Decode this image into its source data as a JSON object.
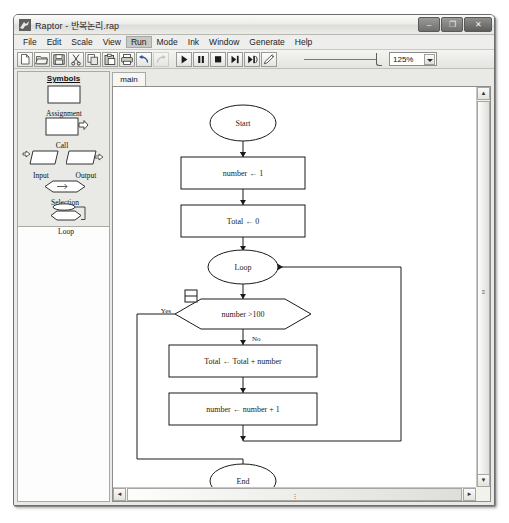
{
  "window": {
    "title": "Raptor - 반복논리.rap",
    "app_icon": "raptor-bird-icon",
    "controls": {
      "minimize": "–",
      "maximize": "❐",
      "close": "✕"
    }
  },
  "menu": {
    "items": [
      {
        "label": "File",
        "mnemonic": "F"
      },
      {
        "label": "Edit",
        "mnemonic": "E"
      },
      {
        "label": "Scale",
        "mnemonic": "S"
      },
      {
        "label": "View",
        "mnemonic": "V"
      },
      {
        "label": "Run",
        "mnemonic": "R",
        "active": true
      },
      {
        "label": "Mode",
        "mnemonic": "M"
      },
      {
        "label": "Ink",
        "mnemonic": "I"
      },
      {
        "label": "Window",
        "mnemonic": "W"
      },
      {
        "label": "Generate",
        "mnemonic": "G"
      },
      {
        "label": "Help",
        "mnemonic": "H"
      }
    ]
  },
  "toolbar": {
    "buttons": [
      {
        "name": "new-file-icon",
        "enabled": true
      },
      {
        "name": "open-folder-icon",
        "enabled": true
      },
      {
        "name": "save-disk-icon",
        "enabled": true
      },
      {
        "name": "cut-scissors-icon",
        "enabled": true
      },
      {
        "name": "copy-icon",
        "enabled": true
      },
      {
        "name": "paste-icon",
        "enabled": true
      },
      {
        "name": "print-icon",
        "enabled": true
      },
      {
        "name": "undo-arrow-icon",
        "enabled": true
      },
      {
        "name": "redo-arrow-icon",
        "enabled": false
      },
      {
        "name": "run-play-icon",
        "enabled": true
      },
      {
        "name": "pause-icon",
        "enabled": true
      },
      {
        "name": "stop-icon",
        "enabled": true
      },
      {
        "name": "step-icon",
        "enabled": true
      },
      {
        "name": "step-into-icon",
        "enabled": true
      },
      {
        "name": "pencil-ink-icon",
        "enabled": true
      }
    ],
    "zoom_value": "125%",
    "speed_slider_label": "execution-speed-slider"
  },
  "sidebar": {
    "title": "Symbols",
    "symbols": [
      {
        "label": "Assignment",
        "shape": "rectangle"
      },
      {
        "label": "Call",
        "shape": "rectangle-with-arrow"
      },
      {
        "label": "Input",
        "shape": "parallelogram-in"
      },
      {
        "label": "Output",
        "shape": "parallelogram-out"
      },
      {
        "label": "Selection",
        "shape": "diamond"
      },
      {
        "label": "Loop",
        "shape": "loop"
      }
    ]
  },
  "tabs": [
    {
      "label": "main",
      "selected": true
    }
  ],
  "scrollbars": {
    "vertical": {
      "up": "▲",
      "down": "▼",
      "grip": "≡"
    },
    "horizontal": {
      "left": "◄",
      "right": "►",
      "grip": "⋮"
    }
  },
  "flowchart": {
    "title": "main",
    "nodes": [
      {
        "id": "start",
        "type": "oval",
        "text": "Start"
      },
      {
        "id": "init_num",
        "type": "rectangle",
        "text": "number ← 1"
      },
      {
        "id": "init_tot",
        "type": "rectangle",
        "text": "Total ← 0"
      },
      {
        "id": "loop",
        "type": "oval",
        "text": "Loop"
      },
      {
        "id": "cond",
        "type": "diamond",
        "text": "number >100"
      },
      {
        "id": "accum",
        "type": "rectangle",
        "text": "Total ← Total + number"
      },
      {
        "id": "incr",
        "type": "rectangle",
        "text": "number ← number + 1"
      },
      {
        "id": "end",
        "type": "oval",
        "text": "End"
      }
    ],
    "branch_labels": {
      "yes": "Yes",
      "no": "No"
    }
  }
}
